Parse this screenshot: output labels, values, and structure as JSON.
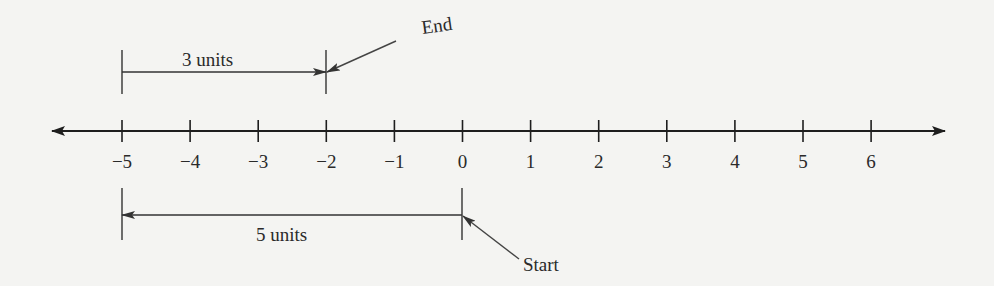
{
  "diagram": {
    "type": "number_line",
    "axis": {
      "min": -5,
      "max": 6,
      "ticks": [
        -5,
        -4,
        -3,
        -2,
        -1,
        0,
        1,
        2,
        3,
        4,
        5,
        6
      ],
      "tick_labels": [
        "−5",
        "−4",
        "−3",
        "−2",
        "−1",
        "0",
        "1",
        "2",
        "3",
        "4",
        "5",
        "6"
      ],
      "arrows_both_ends": true
    },
    "top_bracket": {
      "from": -5,
      "to": -2,
      "direction": "right",
      "label": "3 units"
    },
    "bottom_bracket": {
      "from": 0,
      "to": -5,
      "direction": "left",
      "label": "5 units"
    },
    "callouts": {
      "end": {
        "label": "End",
        "points_to": -2
      },
      "start": {
        "label": "Start",
        "points_to": 0
      }
    },
    "colors": {
      "ink": "#1e1e1e",
      "background": "#f4f4f2",
      "callout": "#444444"
    }
  }
}
